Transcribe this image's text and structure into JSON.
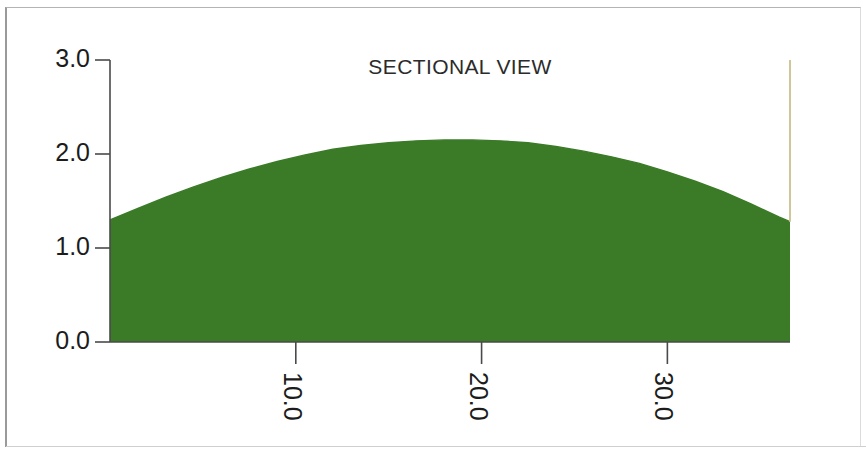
{
  "chart_data": {
    "type": "area",
    "title": "SECTIONAL VIEW",
    "xlabel": "",
    "ylabel": "",
    "xlim": [
      0.0,
      36.6
    ],
    "ylim": [
      0.0,
      3.0
    ],
    "grid": false,
    "legend": null,
    "fill_color": "#3b7b28",
    "line_color": "#3b7b28",
    "y_ticks": [
      {
        "value": 0.0,
        "label": "0.0"
      },
      {
        "value": 1.0,
        "label": "1.0"
      },
      {
        "value": 2.0,
        "label": "2.0"
      },
      {
        "value": 3.0,
        "label": "3.0"
      }
    ],
    "x_ticks": [
      {
        "value": 10.0,
        "label": "10.0"
      },
      {
        "value": 20.0,
        "label": "20.0"
      },
      {
        "value": 30.0,
        "label": "30.0"
      }
    ],
    "series": [
      {
        "name": "section profile",
        "x": [
          0.0,
          1.5,
          3.0,
          4.5,
          6.0,
          7.5,
          9.0,
          10.5,
          12.0,
          13.5,
          15.0,
          16.5,
          18.0,
          19.5,
          21.0,
          22.5,
          24.0,
          25.5,
          27.0,
          28.5,
          30.0,
          31.5,
          33.0,
          34.5,
          36.0,
          36.6
        ],
        "y": [
          1.3,
          1.42,
          1.54,
          1.65,
          1.75,
          1.84,
          1.92,
          1.99,
          2.05,
          2.09,
          2.12,
          2.14,
          2.15,
          2.15,
          2.14,
          2.12,
          2.08,
          2.03,
          1.97,
          1.9,
          1.81,
          1.71,
          1.6,
          1.47,
          1.33,
          1.28
        ]
      }
    ],
    "baseline": 0.0,
    "right_edge_marker": {
      "x": 36.6,
      "y_top": 3.0,
      "y_bottom": 1.28,
      "color": "#cfc79a"
    }
  },
  "axes": {
    "y_axis_label_values": [
      "3.0",
      "2.0",
      "1.0",
      "0.0"
    ],
    "x_axis_label_values": [
      "10.0",
      "20.0",
      "30.0"
    ]
  }
}
